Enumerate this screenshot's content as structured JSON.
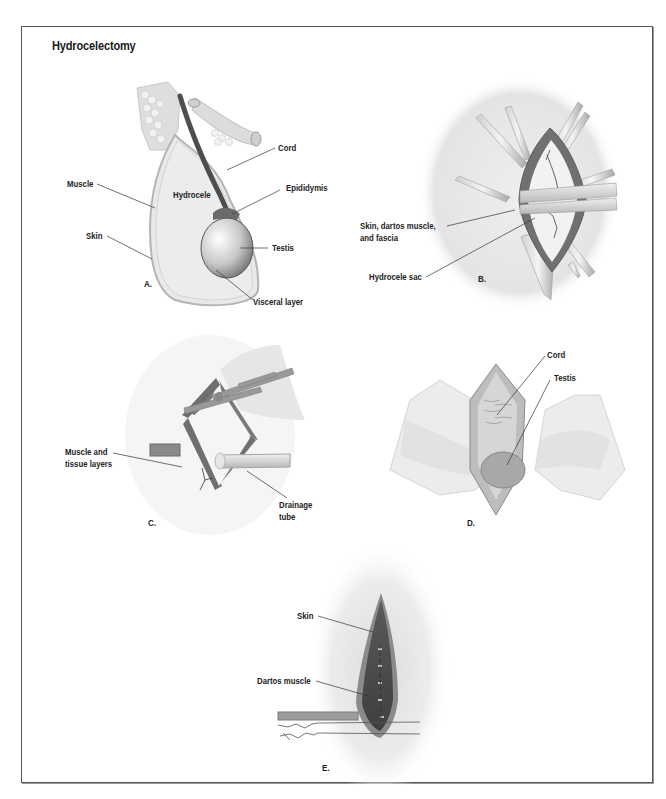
{
  "figure": {
    "title": "Hydrocelectomy",
    "panels": [
      {
        "id": "A",
        "letter": "A.",
        "labels": [
          "Cord",
          "Muscle",
          "Hydrocele",
          "Epididymis",
          "Skin",
          "Testis",
          "Visceral layer"
        ]
      },
      {
        "id": "B",
        "letter": "B.",
        "labels": [
          "Skin, dartos muscle,",
          "and fascia",
          "Hydrocele sac"
        ]
      },
      {
        "id": "C",
        "letter": "C.",
        "labels": [
          "Muscle and",
          "tissue layers",
          "Drainage",
          "tube"
        ]
      },
      {
        "id": "D",
        "letter": "D.",
        "labels": [
          "Cord",
          "Testis"
        ]
      },
      {
        "id": "E",
        "letter": "E.",
        "labels": [
          "Skin",
          "Dartos muscle"
        ]
      }
    ]
  },
  "colors": {
    "frame": "#555555",
    "tissue_light": "#e8e8e8",
    "tissue_mid": "#a0a0a0",
    "tissue_dark": "#555555",
    "leader_line": "#333333"
  }
}
